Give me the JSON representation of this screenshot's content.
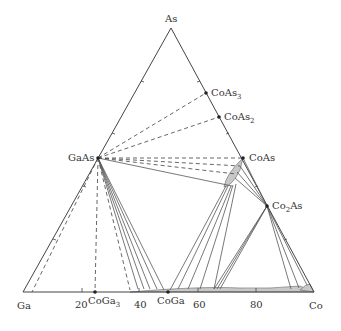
{
  "diagram": {
    "type": "ternary-phase-diagram",
    "corners": {
      "top": {
        "label": "As",
        "x": 171,
        "y": 28
      },
      "left": {
        "label": "Ga",
        "x": 23,
        "y": 292
      },
      "right": {
        "label": "Co",
        "x": 314,
        "y": 292
      }
    },
    "phases": [
      {
        "id": "GaAs",
        "label": "GaAs",
        "x": 98,
        "y": 158
      },
      {
        "id": "CoAs",
        "label": "CoAs",
        "x": 243,
        "y": 158
      },
      {
        "id": "CoAs3",
        "label": "CoAs",
        "sub": "3",
        "x": 206,
        "y": 93
      },
      {
        "id": "CoAs2",
        "label": "CoAs",
        "sub": "2",
        "x": 219,
        "y": 117
      },
      {
        "id": "Co2As",
        "label": "Co",
        "sub": "2",
        "label2": "As",
        "x": 267,
        "y": 206
      },
      {
        "id": "CoGa3",
        "label": "CoGa",
        "sub": "3",
        "x": 95,
        "y": 292
      },
      {
        "id": "CoGa",
        "label": "CoGa",
        "x": 168,
        "y": 292
      }
    ],
    "axis_ticks": [
      {
        "label": "20",
        "x": 82
      },
      {
        "label": "40",
        "x": 139
      },
      {
        "label": "60",
        "x": 198
      },
      {
        "label": "80",
        "x": 256
      }
    ],
    "colors": {
      "line": "#555555",
      "region_fill": "#c8c8c8"
    }
  }
}
